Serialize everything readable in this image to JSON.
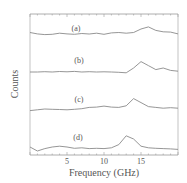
{
  "chart_data": {
    "type": "line",
    "title": "",
    "xlabel": "Frequency (GHz)",
    "ylabel": "Counts",
    "xlim": [
      0,
      20
    ],
    "xticks": [
      5,
      10,
      15
    ],
    "xtick_labels": [
      "5",
      "10",
      "15"
    ],
    "grid": false,
    "legend": "inline labels left of each trace",
    "stacked_offset": true,
    "series": [
      {
        "name": "(a)",
        "x": [
          0,
          1,
          2,
          3,
          4,
          5,
          6,
          7,
          8,
          9,
          10,
          11,
          12,
          13,
          14,
          15,
          16,
          17,
          18,
          19,
          20
        ],
        "values": [
          0.55,
          0.45,
          0.4,
          0.42,
          0.5,
          0.45,
          0.42,
          0.48,
          0.44,
          0.5,
          0.42,
          0.52,
          0.55,
          0.5,
          0.55,
          0.8,
          0.95,
          0.7,
          0.6,
          0.58,
          0.45
        ]
      },
      {
        "name": "(b)",
        "x": [
          0,
          1,
          2,
          3,
          4,
          5,
          6,
          7,
          8,
          9,
          10,
          11,
          12,
          13,
          14,
          15,
          16,
          17,
          18,
          19,
          20
        ],
        "values": [
          0.3,
          0.3,
          0.32,
          0.3,
          0.33,
          0.31,
          0.34,
          0.3,
          0.32,
          0.3,
          0.31,
          0.3,
          0.28,
          0.25,
          0.55,
          0.95,
          0.7,
          0.45,
          0.55,
          0.4,
          0.35
        ]
      },
      {
        "name": "(c)",
        "x": [
          0,
          1,
          2,
          3,
          4,
          5,
          6,
          7,
          8,
          9,
          10,
          11,
          12,
          13,
          14,
          15,
          16,
          17,
          18,
          19,
          20
        ],
        "values": [
          0.2,
          0.25,
          0.3,
          0.28,
          0.27,
          0.25,
          0.28,
          0.32,
          0.4,
          0.42,
          0.48,
          0.42,
          0.4,
          0.5,
          0.95,
          0.7,
          0.45,
          0.4,
          0.35,
          0.38,
          0.35
        ]
      },
      {
        "name": "(d)",
        "x": [
          0,
          1,
          2,
          3,
          4,
          5,
          6,
          7,
          8,
          9,
          10,
          11,
          12,
          13,
          14,
          15,
          16,
          17,
          18,
          19,
          20
        ],
        "values": [
          0.3,
          0.05,
          0.2,
          0.3,
          0.35,
          0.3,
          0.22,
          0.25,
          0.2,
          0.22,
          0.2,
          0.25,
          0.45,
          1.0,
          0.8,
          0.35,
          0.25,
          0.22,
          0.2,
          0.18,
          0.15
        ]
      }
    ]
  },
  "labels": {
    "xlabel": "Frequency (GHz)",
    "ylabel": "Counts",
    "series": [
      "(a)",
      "(b)",
      "(c)",
      "(d)"
    ],
    "ticks": [
      "5",
      "10",
      "15"
    ]
  },
  "colors": {
    "line": "#8a8a8a",
    "frame": "#9a9a9a",
    "text": "#555555"
  }
}
